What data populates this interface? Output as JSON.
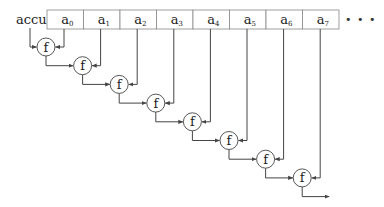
{
  "diagram": {
    "type": "fold-left-chain",
    "accumulator_label": "accu",
    "array": {
      "cells": [
        {
          "base": "a",
          "sub": "0"
        },
        {
          "base": "a",
          "sub": "1"
        },
        {
          "base": "a",
          "sub": "2"
        },
        {
          "base": "a",
          "sub": "3"
        },
        {
          "base": "a",
          "sub": "4"
        },
        {
          "base": "a",
          "sub": "5"
        },
        {
          "base": "a",
          "sub": "6"
        },
        {
          "base": "a",
          "sub": "7"
        }
      ],
      "continuation": "• • •"
    },
    "function_nodes": [
      {
        "label": "f"
      },
      {
        "label": "f"
      },
      {
        "label": "f"
      },
      {
        "label": "f"
      },
      {
        "label": "f"
      },
      {
        "label": "f"
      },
      {
        "label": "f"
      },
      {
        "label": "f"
      }
    ],
    "colors": {
      "line": "#444444",
      "box_border": "#888888",
      "text": "#222222"
    }
  }
}
